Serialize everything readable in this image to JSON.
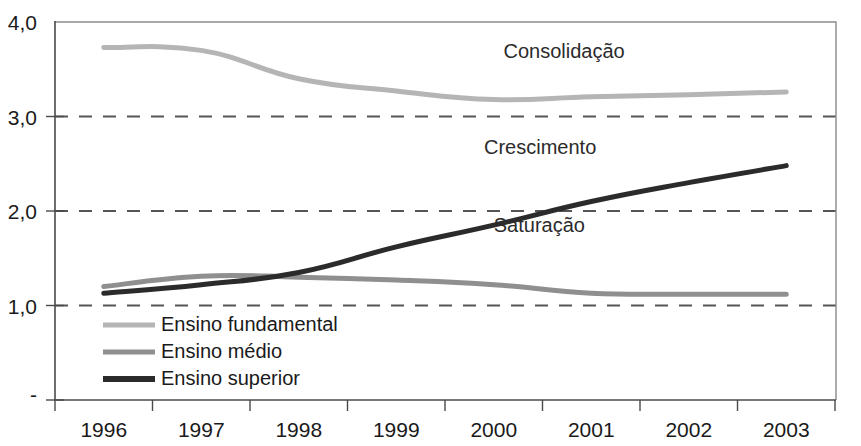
{
  "chart_data": {
    "type": "line",
    "title": "",
    "subtitle": "",
    "xlabel": "",
    "ylabel": "",
    "categories": [
      "1996",
      "1997",
      "1998",
      "1999",
      "2000",
      "2001",
      "2002",
      "2003"
    ],
    "ylim": [
      0,
      4.0
    ],
    "ytick_labels": [
      "-",
      "1,0",
      "2,0",
      "3,0",
      "4,0"
    ],
    "ytick_values": [
      0,
      1.0,
      2.0,
      3.0,
      4.0
    ],
    "gridlines": [
      1.0,
      2.0,
      3.0
    ],
    "grid": "horizontal-dashed",
    "legend_position": "inside-bottom-left",
    "series": [
      {
        "name": "Ensino fundamental",
        "color": "#b5b5b5",
        "width": 5,
        "values": [
          3.73,
          3.7,
          3.4,
          3.27,
          3.18,
          3.21,
          3.23,
          3.26
        ]
      },
      {
        "name": "Ensino médio",
        "color": "#8f8f8f",
        "width": 5,
        "values": [
          1.2,
          1.31,
          1.3,
          1.27,
          1.22,
          1.13,
          1.12,
          1.12
        ]
      },
      {
        "name": "Ensino superior",
        "color": "#2b2b2b",
        "width": 5,
        "values": [
          1.13,
          1.22,
          1.35,
          1.62,
          1.85,
          2.1,
          2.3,
          2.48
        ]
      }
    ],
    "annotations": [
      {
        "text": "Consolidação",
        "x_value": 2000.1,
        "y_value": 3.62
      },
      {
        "text": "Crescimento",
        "x_value": 1999.9,
        "y_value": 2.6
      },
      {
        "text": "Saturação",
        "x_value": 2000.0,
        "y_value": 1.78
      }
    ]
  },
  "axes": {
    "y_ticks": [
      {
        "label": "4,0",
        "value": 4.0
      },
      {
        "label": "3,0",
        "value": 3.0
      },
      {
        "label": "2,0",
        "value": 2.0
      },
      {
        "label": "1,0",
        "value": 1.0
      },
      {
        "label": "-",
        "value": 0
      }
    ],
    "x_ticks": [
      {
        "label": "1996"
      },
      {
        "label": "1997"
      },
      {
        "label": "1998"
      },
      {
        "label": "1999"
      },
      {
        "label": "2000"
      },
      {
        "label": "2001"
      },
      {
        "label": "2002"
      },
      {
        "label": "2003"
      }
    ]
  },
  "legend": {
    "entries": [
      {
        "label": "Ensino fundamental",
        "color": "#b5b5b5"
      },
      {
        "label": "Ensino médio",
        "color": "#8f8f8f"
      },
      {
        "label": "Ensino superior",
        "color": "#2b2b2b"
      }
    ]
  }
}
